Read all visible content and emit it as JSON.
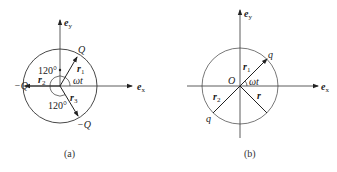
{
  "figure_a": {
    "caption": "(a)",
    "axis_x": "e",
    "axis_x_sub": "x",
    "axis_y": "e",
    "axis_y_sub": "y",
    "charge_top": "Q",
    "charge_left": "−Q",
    "charge_bottom": "−Q",
    "r1": "r",
    "r1_sub": "1",
    "r2": "r",
    "r2_sub": "2",
    "r3": "r",
    "r3_sub": "3",
    "angle_top": "120°",
    "angle_bottom": "120°",
    "angle_wt": "ωt"
  },
  "figure_b": {
    "caption": "(b)",
    "axis_x": "e",
    "axis_x_sub": "x",
    "axis_y": "e",
    "axis_y_sub": "y",
    "origin": "O",
    "charge_top": "q",
    "charge_bottom": "q",
    "r1": "r",
    "r1_sub": "1",
    "r2": "r",
    "r2_sub": "2",
    "r": "r",
    "angle_wt": "ωt"
  }
}
